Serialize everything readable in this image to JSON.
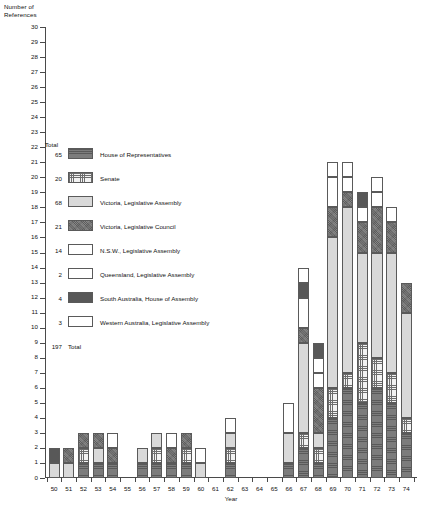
{
  "axes": {
    "y_title": "Number of\nReferences",
    "x_title": "Year",
    "y_ticks": [
      0,
      1,
      2,
      3,
      4,
      5,
      6,
      7,
      8,
      9,
      10,
      11,
      12,
      13,
      14,
      15,
      16,
      17,
      18,
      19,
      20,
      21,
      22,
      23,
      24,
      25,
      26,
      27,
      28,
      29,
      30
    ],
    "y_min": 0,
    "y_max": 30,
    "x_ticks": [
      "50",
      "51",
      "52",
      "53",
      "54",
      "55",
      "56",
      "57",
      "58",
      "59",
      "60",
      "61",
      "62",
      "63",
      "64",
      "65",
      "66",
      "67",
      "68",
      "69",
      "70",
      "71",
      "72",
      "73",
      "74"
    ]
  },
  "legend": {
    "total_header": "Total",
    "footer_total_label": "Total",
    "footer_total_value": "197",
    "items": [
      {
        "total": "65",
        "label": "House of Representatives",
        "pattern": "p-hor"
      },
      {
        "total": "20",
        "label": "Senate",
        "pattern": "p-grid-dark"
      },
      {
        "total": "68",
        "label": "Victoria, Legislative Assembly",
        "pattern": "p-light"
      },
      {
        "total": "21",
        "label": "Victoria, Legislative Council",
        "pattern": "p-dark"
      },
      {
        "total": "14",
        "label": "N.S.W., Legislative Assembly",
        "pattern": "p-white"
      },
      {
        "total": "2",
        "label": "Queensland, Legislative Assembly",
        "pattern": "p-white2"
      },
      {
        "total": "4",
        "label": "South Australia, House of Assembly",
        "pattern": "p-darkest"
      },
      {
        "total": "3",
        "label": "Western Australia, Legislative Assembly",
        "pattern": "p-white3"
      }
    ]
  },
  "chart_data": {
    "type": "bar",
    "title": "",
    "subtitle": "",
    "xlabel": "Year",
    "ylabel": "Number of References",
    "ylim": [
      0,
      30
    ],
    "grid": false,
    "legend_position": "inside-left",
    "stacked": true,
    "categories": [
      "50",
      "51",
      "52",
      "53",
      "54",
      "55",
      "56",
      "57",
      "58",
      "59",
      "60",
      "61",
      "62",
      "63",
      "64",
      "65",
      "66",
      "67",
      "68",
      "69",
      "70",
      "71",
      "72",
      "73",
      "74"
    ],
    "series": [
      {
        "name": "House of Representatives",
        "pattern": "p-hor",
        "total": 65,
        "values": [
          0,
          0,
          1,
          1,
          1,
          0,
          1,
          1,
          1,
          1,
          0,
          0,
          1,
          0,
          0,
          0,
          1,
          2,
          1,
          4,
          6,
          5,
          6,
          5,
          3
        ]
      },
      {
        "name": "Senate",
        "pattern": "p-grid-dark",
        "total": 20,
        "values": [
          0,
          0,
          1,
          0,
          0,
          0,
          0,
          1,
          0,
          1,
          0,
          0,
          1,
          0,
          0,
          0,
          0,
          1,
          1,
          2,
          1,
          4,
          2,
          2,
          1
        ]
      },
      {
        "name": "Victoria, Legislative Assembly",
        "pattern": "p-light",
        "total": 68,
        "values": [
          1,
          1,
          0,
          1,
          0,
          0,
          1,
          1,
          0,
          0,
          1,
          0,
          1,
          0,
          0,
          0,
          2,
          6,
          1,
          10,
          11,
          6,
          7,
          8,
          7
        ]
      },
      {
        "name": "Victoria, Legislative Council",
        "pattern": "p-dark",
        "total": 21,
        "values": [
          0,
          1,
          1,
          1,
          1,
          0,
          0,
          0,
          1,
          1,
          0,
          0,
          0,
          0,
          0,
          0,
          0,
          1,
          3,
          2,
          1,
          2,
          3,
          2,
          2
        ]
      },
      {
        "name": "N.S.W., Legislative Assembly",
        "pattern": "p-white",
        "total": 14,
        "values": [
          0,
          0,
          0,
          0,
          1,
          0,
          0,
          0,
          1,
          0,
          1,
          0,
          1,
          0,
          0,
          0,
          2,
          2,
          1,
          2,
          1,
          1,
          1,
          1,
          0
        ]
      },
      {
        "name": "Queensland, Legislative Assembly",
        "pattern": "p-white2",
        "total": 2,
        "values": [
          0,
          0,
          0,
          0,
          0,
          0,
          0,
          0,
          0,
          0,
          0,
          0,
          0,
          0,
          0,
          0,
          0,
          0,
          1,
          0,
          0,
          0,
          1,
          0,
          0
        ]
      },
      {
        "name": "South Australia, House of Assembly",
        "pattern": "p-darkest",
        "total": 4,
        "values": [
          1,
          0,
          0,
          0,
          0,
          0,
          0,
          0,
          0,
          0,
          0,
          0,
          0,
          0,
          0,
          0,
          0,
          1,
          1,
          0,
          0,
          1,
          0,
          0,
          0
        ]
      },
      {
        "name": "Western Australia, Legislative Assembly",
        "pattern": "p-white3",
        "total": 3,
        "values": [
          0,
          0,
          0,
          0,
          0,
          0,
          0,
          0,
          0,
          0,
          0,
          0,
          0,
          0,
          0,
          0,
          0,
          1,
          0,
          1,
          1,
          0,
          0,
          0,
          0
        ]
      }
    ],
    "bar_totals": [
      2,
      2,
      3,
      3,
      3,
      0,
      2,
      3,
      3,
      3,
      2,
      0,
      3,
      0,
      0,
      0,
      5,
      14,
      9,
      21,
      22,
      19,
      21,
      25,
      15
    ]
  }
}
